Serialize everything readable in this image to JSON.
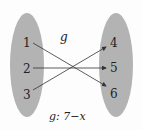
{
  "diagram": {
    "function_name": "g",
    "caption": "g: 7−x",
    "domain": [
      "1",
      "2",
      "3"
    ],
    "codomain": [
      "4",
      "5",
      "6"
    ],
    "mappings": [
      {
        "from": "1",
        "to": "6"
      },
      {
        "from": "2",
        "to": "5"
      },
      {
        "from": "3",
        "to": "4"
      }
    ],
    "colors": {
      "set_fill": "#b3b3b3",
      "arrow": "#333333"
    }
  }
}
